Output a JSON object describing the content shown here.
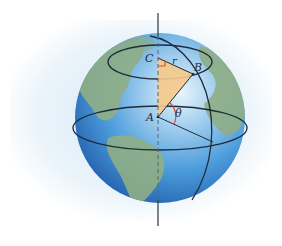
{
  "diagram": {
    "labels": {
      "point_a": "A",
      "point_b": "B",
      "point_c": "C",
      "radius": "r",
      "angle": "θ"
    },
    "colors": {
      "ocean_light": "#bfe0f5",
      "ocean_mid": "#5aa6e0",
      "ocean_dark": "#1f5fae",
      "land": "#8fae86",
      "triangle_fill": "#f6c98a",
      "angle_arc": "#d9403a",
      "right_angle_marker": "#e0552e",
      "lines": "#1e2c3a",
      "background_haze": "#e3f0f9"
    }
  }
}
